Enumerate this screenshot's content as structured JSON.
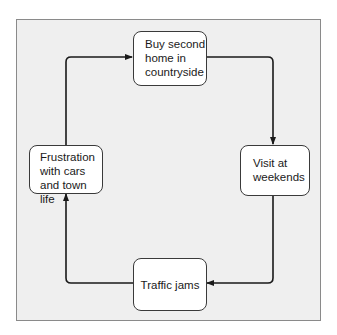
{
  "diagram": {
    "type": "cycle",
    "nodes": [
      {
        "id": "top",
        "label_lines": [
          "Buy second",
          "home in",
          "countryside"
        ]
      },
      {
        "id": "right",
        "label_lines": [
          "Visit at",
          "weekends"
        ]
      },
      {
        "id": "bottom",
        "label_lines": [
          "Traffic jams"
        ]
      },
      {
        "id": "left",
        "label_lines": [
          "Frustration",
          "with cars",
          "and town life"
        ]
      }
    ],
    "edges": [
      {
        "from": "top",
        "to": "right"
      },
      {
        "from": "right",
        "to": "bottom"
      },
      {
        "from": "bottom",
        "to": "left"
      },
      {
        "from": "left",
        "to": "top"
      }
    ],
    "colors": {
      "panel": "#efefef",
      "line": "#1a1a1a",
      "box": "#ffffff"
    }
  }
}
